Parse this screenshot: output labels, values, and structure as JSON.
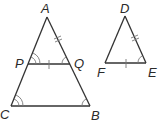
{
  "diagram": {
    "colors": {
      "edge": "#333333",
      "mark": "#777777",
      "label": "#2a2a2a",
      "background": "#ffffff"
    },
    "figure1": {
      "vertices": {
        "A": {
          "label": "A",
          "x": 47,
          "y": 17
        },
        "P": {
          "label": "P",
          "x": 28,
          "y": 64
        },
        "Q": {
          "label": "Q",
          "x": 70,
          "y": 64
        },
        "C": {
          "label": "C",
          "x": 11,
          "y": 106
        },
        "B": {
          "label": "B",
          "x": 90,
          "y": 106
        }
      },
      "segments": [
        "AC",
        "AB",
        "PQ",
        "CB"
      ],
      "marks": {
        "AQ_tick": "double tick",
        "PQ_tick": "single tick",
        "angle_P": "double arc",
        "angle_Q": "single arc",
        "angle_C": "double arc",
        "angle_B": "single arc"
      }
    },
    "figure2": {
      "vertices": {
        "D": {
          "label": "D",
          "x": 125,
          "y": 16
        },
        "F": {
          "label": "F",
          "x": 105,
          "y": 63
        },
        "E": {
          "label": "E",
          "x": 146,
          "y": 63
        }
      },
      "segments": [
        "DF",
        "DE",
        "FE"
      ],
      "marks": {
        "DE_tick": "double tick",
        "FE_tick": "single tick",
        "angle_E": "single arc"
      }
    }
  }
}
